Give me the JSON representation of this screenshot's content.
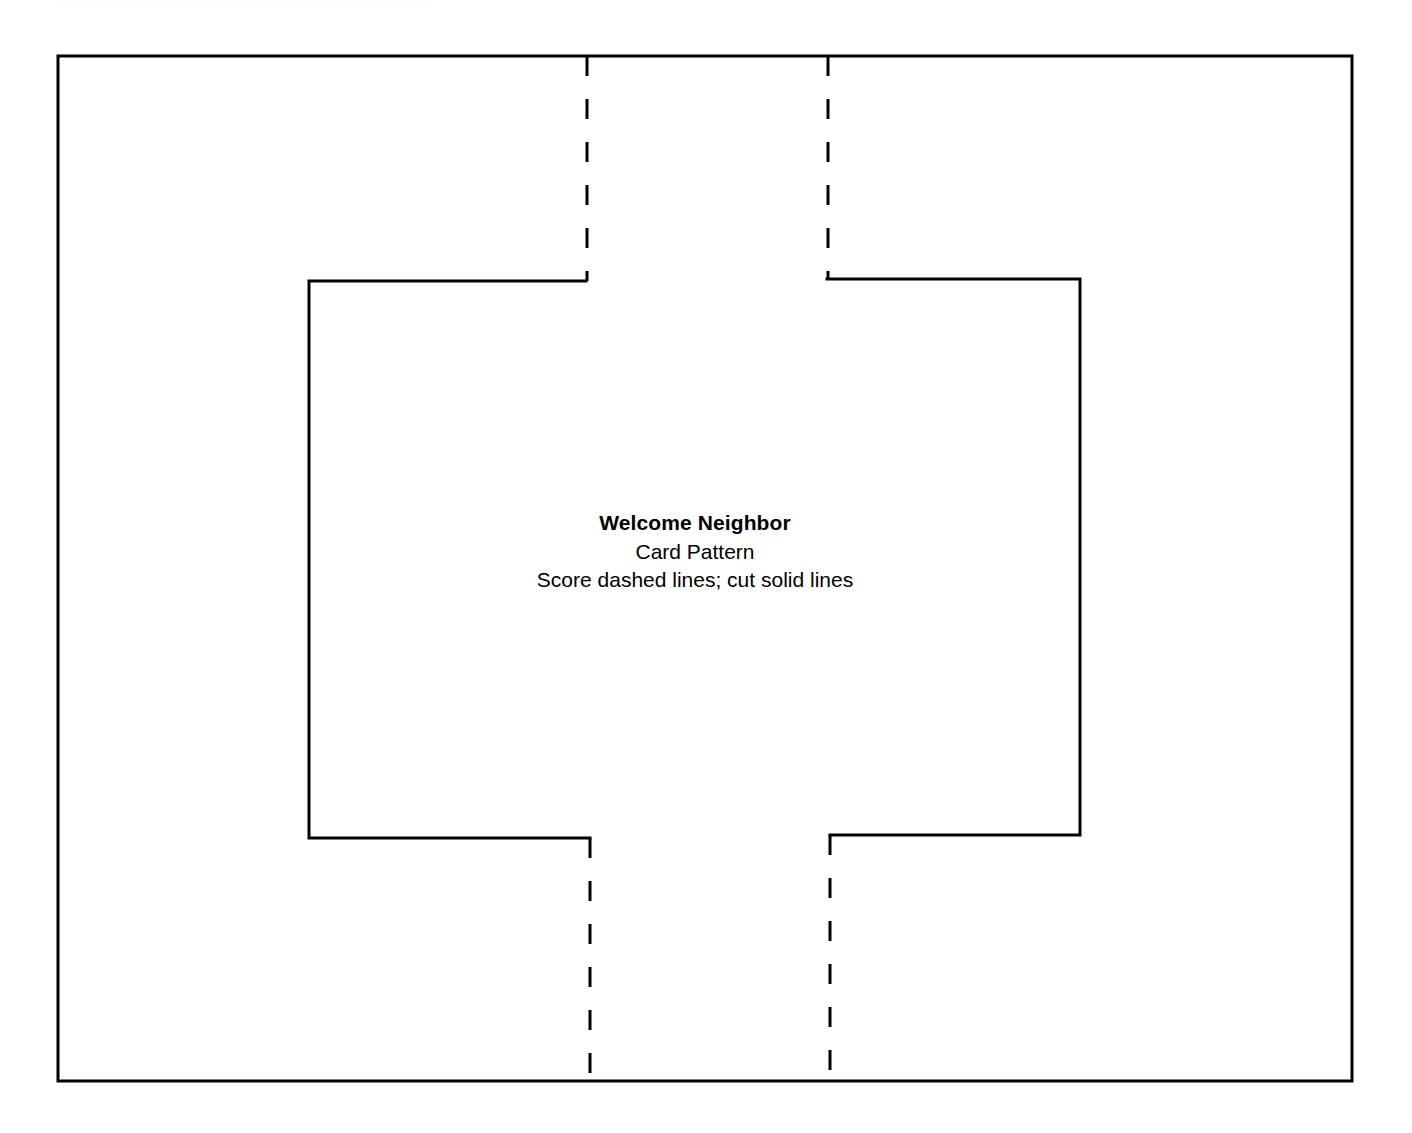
{
  "document": {
    "kind": "printable-card-pattern",
    "background_color": "#ffffff",
    "line_color": "#000000"
  },
  "label": {
    "title": "Welcome Neighbor",
    "subtitle": "Card Pattern",
    "instructions": "Score dashed lines; cut solid lines"
  },
  "geometry": {
    "page": {
      "width": 1412,
      "height": 1133
    },
    "outer_border": {
      "name": "outer-page-border",
      "left": 58,
      "top": 56,
      "right": 1352,
      "bottom": 1081,
      "stroke_width": 3,
      "style": "solid"
    },
    "inner_cut_shape": {
      "name": "inner-cut-outline",
      "left": 309,
      "top": 280,
      "right": 1080,
      "bottom": 837,
      "top_gap_start": 586,
      "top_gap_end": 827,
      "bottom_gap_start": 590,
      "bottom_gap_end": 830,
      "stroke_width": 3,
      "style": "solid"
    },
    "score_lines": [
      {
        "name": "score-line-top-left",
        "x": 587,
        "y_start": 56,
        "y_end": 281
      },
      {
        "name": "score-line-top-right",
        "x": 828,
        "y_start": 56,
        "y_end": 279
      },
      {
        "name": "score-line-bottom-left",
        "x": 590,
        "y_start": 838,
        "y_end": 1081
      },
      {
        "name": "score-line-bottom-right",
        "x": 830,
        "y_start": 835,
        "y_end": 1081
      }
    ],
    "dash_pattern": {
      "dash": 20,
      "gap": 23,
      "stroke_width": 3
    }
  }
}
